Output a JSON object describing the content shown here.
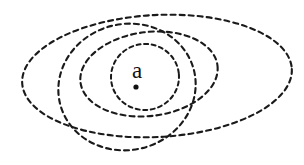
{
  "figure": {
    "width": 304,
    "height": 165,
    "background_color": "#ffffff",
    "stroke_color": "#1a1a1a",
    "title": ""
  },
  "point": {
    "label": "a",
    "label_x": 137,
    "label_y": 78,
    "label_font_size": 23,
    "dot_x": 136,
    "dot_y": 87,
    "dot_radius": 2.6,
    "dot_color": "#111111"
  },
  "chart_data": {
    "type": "diagram",
    "title": "",
    "xlabel": "",
    "ylabel": "",
    "annotations": [
      {
        "text": "a",
        "x": 137,
        "y": 78
      }
    ],
    "curves": [
      {
        "name": "outermost-neighborhood",
        "shape": "ellipse",
        "cx": 157,
        "cy": 76,
        "rx": 135,
        "ry": 61,
        "rotation": -3,
        "dash": "5 4",
        "stroke_width": 2.1
      },
      {
        "name": "second-neighborhood",
        "shape": "ellipse",
        "cx": 127,
        "cy": 87,
        "rx": 69,
        "ry": 63,
        "rotation": -14,
        "dash": "5 4",
        "stroke_width": 2.1
      },
      {
        "name": "third-neighborhood",
        "shape": "ellipse",
        "cx": 149,
        "cy": 74,
        "rx": 69,
        "ry": 42,
        "rotation": -7,
        "dash": "5 4",
        "stroke_width": 2.1
      },
      {
        "name": "innermost-neighborhood",
        "shape": "ellipse",
        "cx": 145,
        "cy": 77,
        "rx": 34,
        "ry": 33,
        "rotation": -5,
        "dash": "4 3.6",
        "stroke_width": 2.0
      }
    ]
  }
}
